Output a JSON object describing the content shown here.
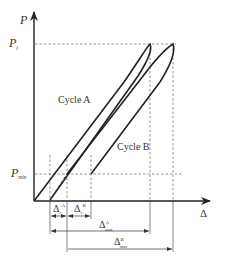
{
  "diagram": {
    "type": "load-displacement hysteresis diagram",
    "axes": {
      "y_label": "P",
      "x_label": "Δ"
    },
    "levels": {
      "p_i": {
        "base": "P",
        "sub": "i"
      },
      "p_min": {
        "base": "P",
        "sub": "min"
      }
    },
    "curves": {
      "cycle_a": {
        "label": "Cycle A"
      },
      "cycle_b": {
        "label": "Cycle B"
      }
    },
    "dimensions": {
      "delta_r_a": {
        "base": "Δ",
        "sub": "r",
        "sup": "A"
      },
      "delta_r_b": {
        "base": "Δ",
        "sub": "r",
        "sup": "B"
      },
      "delta_max_a": {
        "base": "Δ",
        "sub": "max",
        "sup": "A"
      },
      "delta_max_b": {
        "base": "Δ",
        "sub": "max",
        "sup": "B"
      }
    },
    "colors": {
      "stroke": "#222222",
      "dashed": "#777777",
      "text": "#333333"
    }
  }
}
